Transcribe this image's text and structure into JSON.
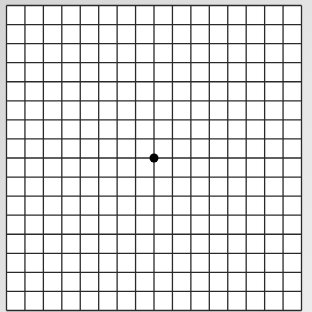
{
  "grid": {
    "columns": 16,
    "rows": 16,
    "line_color": "#2a2a2a",
    "background_color": "#ffffff",
    "fixation_dot_color": "#000000"
  }
}
